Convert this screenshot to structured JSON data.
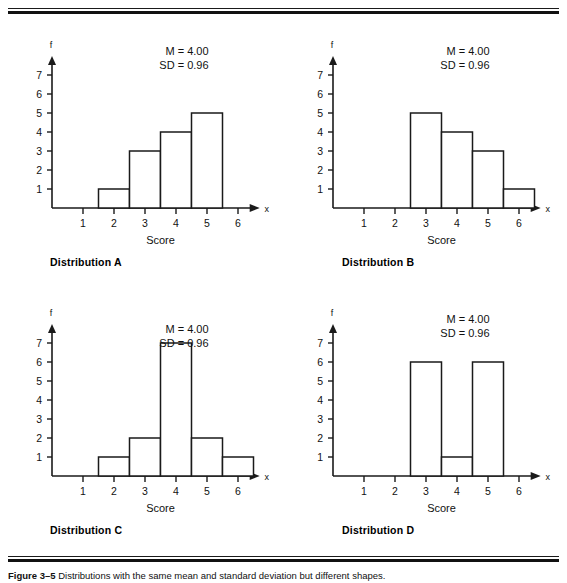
{
  "figure": {
    "caption_label": "Figure 3–5",
    "caption_text": "Distributions with the same mean and standard deviation but different shapes."
  },
  "axes": {
    "y_axis_label": "f",
    "x_axis_label": "x",
    "x_title": "Score",
    "y_ticks": [
      "1",
      "2",
      "3",
      "4",
      "5",
      "6",
      "7"
    ],
    "x_ticks": [
      "1",
      "2",
      "3",
      "4",
      "5",
      "6"
    ]
  },
  "stats_labels": {
    "mean": "M = 4.00",
    "sd": "SD = 0.96"
  },
  "panels": [
    {
      "id": "a",
      "title": "Distribution A"
    },
    {
      "id": "b",
      "title": "Distribution B"
    },
    {
      "id": "c",
      "title": "Distribution C"
    },
    {
      "id": "d",
      "title": "Distribution D"
    }
  ],
  "chart_data": [
    {
      "type": "bar",
      "title": "Distribution A",
      "xlabel": "Score",
      "ylabel": "f",
      "categories": [
        1,
        2,
        3,
        4,
        5,
        6
      ],
      "values": [
        0,
        1,
        3,
        4,
        5,
        0
      ],
      "xlim": [
        0.5,
        6.5
      ],
      "ylim": [
        0,
        7.8
      ],
      "grid": false,
      "annotations": [
        "M = 4.00",
        "SD = 0.96"
      ],
      "mean": 4.0,
      "sd": 0.96
    },
    {
      "type": "bar",
      "title": "Distribution B",
      "xlabel": "Score",
      "ylabel": "f",
      "categories": [
        1,
        2,
        3,
        4,
        5,
        6
      ],
      "values": [
        0,
        0,
        5,
        4,
        3,
        1
      ],
      "xlim": [
        0.5,
        6.5
      ],
      "ylim": [
        0,
        7.8
      ],
      "grid": false,
      "annotations": [
        "M = 4.00",
        "SD = 0.96"
      ],
      "mean": 4.0,
      "sd": 0.96
    },
    {
      "type": "bar",
      "title": "Distribution C",
      "xlabel": "Score",
      "ylabel": "f",
      "categories": [
        1,
        2,
        3,
        4,
        5,
        6
      ],
      "values": [
        0,
        1,
        2,
        7,
        2,
        1
      ],
      "xlim": [
        0.5,
        6.5
      ],
      "ylim": [
        0,
        7.8
      ],
      "grid": false,
      "annotations": [
        "M = 4.00",
        "SD = 0.96"
      ],
      "mean": 4.0,
      "sd": 0.96
    },
    {
      "type": "bar",
      "title": "Distribution D",
      "xlabel": "Score",
      "ylabel": "f",
      "categories": [
        1,
        2,
        3,
        4,
        5,
        6
      ],
      "values": [
        0,
        0,
        6,
        1,
        6,
        0
      ],
      "xlim": [
        0.5,
        6.5
      ],
      "ylim": [
        0,
        7.8
      ],
      "grid": false,
      "annotations": [
        "M = 4.00",
        "SD = 0.96"
      ],
      "mean": 4.0,
      "sd": 0.96
    }
  ]
}
